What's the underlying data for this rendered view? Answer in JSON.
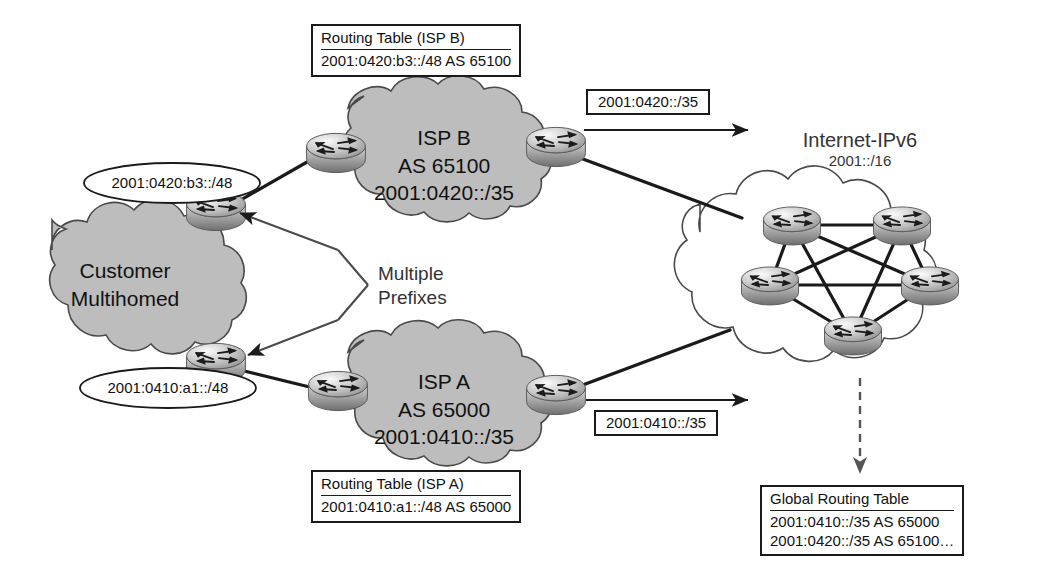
{
  "diagram": {
    "colors": {
      "cloud_fill": "#bdbdbd",
      "cloud_stroke": "#4a4a4a",
      "internet_cloud_fill": "#ffffff",
      "line": "#1a1a1a",
      "router_body": "#a9a9a9",
      "router_light": "#e8e8e8",
      "text": "#111111"
    }
  },
  "clouds": {
    "customer": {
      "line1": "Customer",
      "line2": "Multihomed"
    },
    "isp_b": {
      "line1": "ISP B",
      "line2": "AS 65100",
      "line3": "2001:0420::/35"
    },
    "isp_a": {
      "line1": "ISP A",
      "line2": "AS 65000",
      "line3": "2001:0410::/35"
    },
    "internet": {
      "line1": "Internet-IPv6",
      "line2": "2001::/16"
    }
  },
  "prefix_ellipses": {
    "upper": "2001:0420:b3::/48",
    "lower": "2001:0410:a1::/48"
  },
  "annotations": {
    "multiple_prefixes": {
      "line1": "Multiple",
      "line2": "Prefixes"
    }
  },
  "advertised_prefix_boxes": {
    "isp_b_advert": "2001:0420::/35",
    "isp_a_advert": "2001:0410::/35"
  },
  "routing_tables": {
    "isp_b": {
      "header": "Routing Table (ISP B)",
      "rows": [
        "2001:0420:b3::/48 AS 65100"
      ]
    },
    "isp_a": {
      "header": "Routing Table (ISP A)",
      "rows": [
        "2001:0410:a1::/48 AS 65000"
      ]
    },
    "global": {
      "header": "Global Routing Table",
      "rows": [
        "2001:0410::/35 AS 65000",
        "2001:0420::/35 AS 65100…"
      ]
    }
  },
  "icons": {
    "router": "router-icon",
    "cloud": "cloud-icon",
    "arrow": "arrow-right-icon",
    "dashed_arrow": "dashed-arrow-down-icon"
  },
  "router_labels": {
    "customer_upper": "customer-edge-router-upper",
    "customer_lower": "customer-edge-router-lower",
    "ispb_ingress": "isp-b-ingress-router",
    "ispb_egress": "isp-b-egress-router",
    "ispa_ingress": "isp-a-ingress-router",
    "ispa_egress": "isp-a-egress-router",
    "core": [
      "core-router-1",
      "core-router-2",
      "core-router-3",
      "core-router-4",
      "core-router-5"
    ]
  }
}
